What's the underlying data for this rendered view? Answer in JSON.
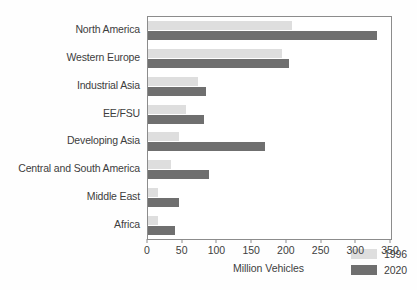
{
  "chart_data": {
    "type": "bar",
    "orientation": "horizontal",
    "title": "",
    "xlabel": "Million Vehicles",
    "ylabel": "",
    "xlim": [
      0,
      350
    ],
    "xticks": [
      0,
      50,
      100,
      150,
      200,
      250,
      300,
      350
    ],
    "grid": false,
    "legend_position": "bottom-right",
    "categories": [
      "North America",
      "Western Europe",
      "Industrial Asia",
      "EE/FSU",
      "Developing Asia",
      "Central and South America",
      "Middle East",
      "Africa"
    ],
    "series": [
      {
        "name": "1996",
        "color": "#dedede",
        "values": [
          207,
          193,
          72,
          55,
          45,
          33,
          14,
          14
        ]
      },
      {
        "name": "2020",
        "color": "#6f6f6f",
        "values": [
          330,
          203,
          84,
          81,
          168,
          88,
          45,
          39
        ]
      }
    ]
  },
  "legend": {
    "items": [
      {
        "label": "1996",
        "color": "#dedede"
      },
      {
        "label": "2020",
        "color": "#6f6f6f"
      }
    ]
  },
  "axis": {
    "x_title": "Million Vehicles",
    "tick_labels": [
      "0",
      "50",
      "100",
      "150",
      "200",
      "250",
      "300",
      "350"
    ]
  },
  "colors": {
    "series_1996": "#dedede",
    "series_2020": "#6f6f6f",
    "axis_line": "#8c8c8c",
    "text": "#3d3d3d",
    "background": "#ffffff"
  }
}
